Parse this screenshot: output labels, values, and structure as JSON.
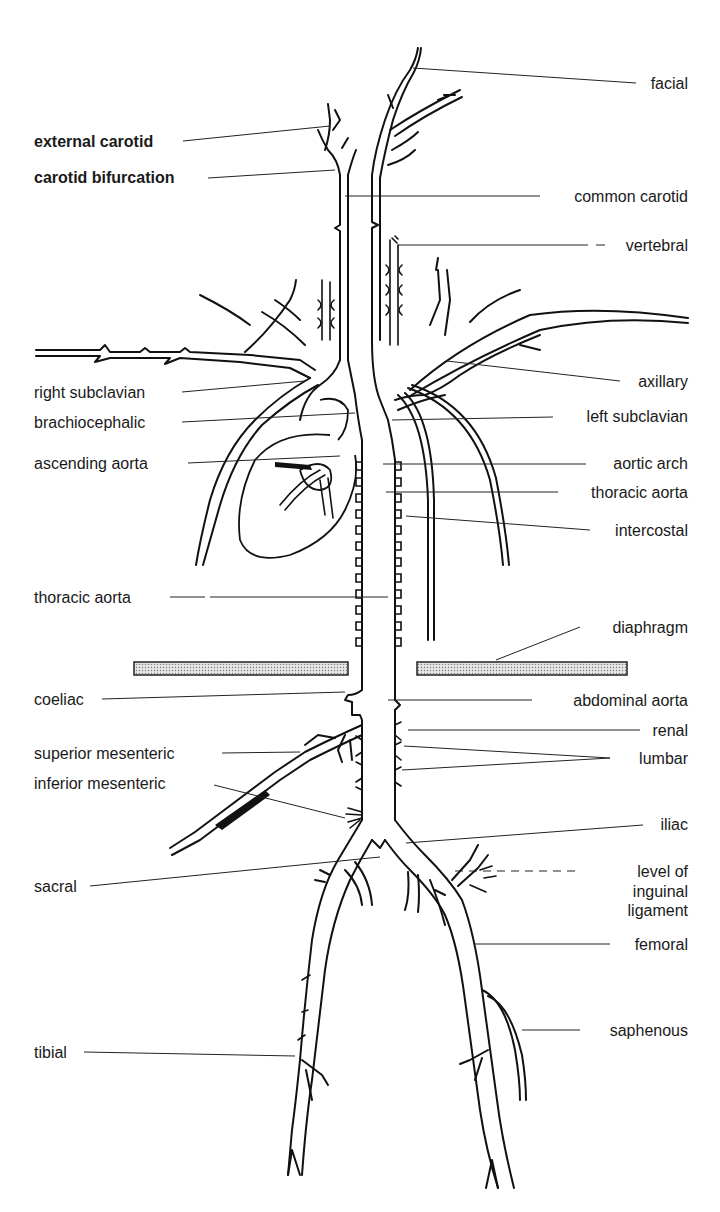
{
  "diagram": {
    "colors": {
      "line": "#111111",
      "background": "#ffffff",
      "diaphragm_fill": "#d4d4d4"
    },
    "labels_left": [
      {
        "id": "external_carotid",
        "text": "external carotid"
      },
      {
        "id": "carotid_bifurcation",
        "text": "carotid bifurcation"
      },
      {
        "id": "right_subclavian",
        "text": "right subclavian"
      },
      {
        "id": "brachiocephalic",
        "text": "brachiocephalic"
      },
      {
        "id": "ascending_aorta",
        "text": "ascending aorta"
      },
      {
        "id": "thoracic_aorta_left",
        "text": "thoracic aorta"
      },
      {
        "id": "coeliac",
        "text": "coeliac"
      },
      {
        "id": "superior_mesenteric",
        "text": "superior mesenteric"
      },
      {
        "id": "inferior_mesenteric",
        "text": "inferior mesenteric"
      },
      {
        "id": "sacral",
        "text": "sacral"
      },
      {
        "id": "tibial",
        "text": "tibial"
      }
    ],
    "labels_right": [
      {
        "id": "facial",
        "text": "facial"
      },
      {
        "id": "common_carotid",
        "text": "common carotid"
      },
      {
        "id": "vertebral",
        "text": "vertebral"
      },
      {
        "id": "axillary",
        "text": "axillary"
      },
      {
        "id": "left_subclavian",
        "text": "left subclavian"
      },
      {
        "id": "aortic_arch",
        "text": "aortic arch"
      },
      {
        "id": "thoracic_aorta_right",
        "text": "thoracic aorta"
      },
      {
        "id": "intercostal",
        "text": "intercostal"
      },
      {
        "id": "diaphragm",
        "text": "diaphragm"
      },
      {
        "id": "abdominal_aorta",
        "text": "abdominal aorta"
      },
      {
        "id": "renal",
        "text": "renal"
      },
      {
        "id": "lumbar",
        "text": "lumbar"
      },
      {
        "id": "iliac",
        "text": "iliac"
      },
      {
        "id": "inguinal_line1",
        "text": "level of"
      },
      {
        "id": "inguinal_line2",
        "text": "inguinal"
      },
      {
        "id": "inguinal_line3",
        "text": "ligament"
      },
      {
        "id": "femoral",
        "text": "femoral"
      },
      {
        "id": "saphenous",
        "text": "saphenous"
      }
    ]
  }
}
